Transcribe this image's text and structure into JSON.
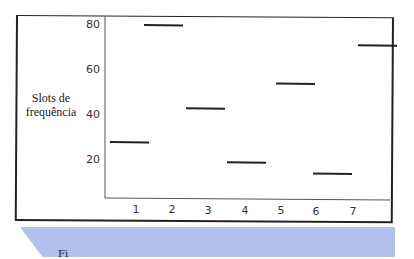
{
  "chart_data": {
    "type": "line",
    "subtype": "horizontal-segments (frequency hopping)",
    "title": "",
    "xlabel": "Tempo",
    "ylabel": "Slots de frequência",
    "x_ticks": [
      "1",
      "2",
      "3",
      "4",
      "5",
      "6",
      "7"
    ],
    "y_ticks": [
      "20",
      "40",
      "60",
      "80"
    ],
    "ylim": [
      0,
      85
    ],
    "grid": false,
    "legend": null,
    "series": [
      {
        "name": "frequency slot per time slot",
        "points": [
          {
            "time": 1,
            "slot": 28
          },
          {
            "time": 2,
            "slot": 80
          },
          {
            "time": 3,
            "slot": 43
          },
          {
            "time": 4,
            "slot": 19
          },
          {
            "time": 5,
            "slot": 54
          },
          {
            "time": 6,
            "slot": 14
          },
          {
            "time": 7,
            "slot": 71
          }
        ]
      }
    ]
  },
  "labels": {
    "ylabel_line1": "Slots de",
    "ylabel_line2": "frequência",
    "xlabel": "Tempo",
    "y_ticks": {
      "t80": "80",
      "t60": "60",
      "t40": "40",
      "t20": "20"
    },
    "x_ticks": [
      "1",
      "2",
      "3",
      "4",
      "5",
      "6",
      "7"
    ],
    "caption_fragment": "Fi"
  },
  "colors": {
    "line": "#222222",
    "axis": "#444444",
    "caption_band": "#b3c1ee"
  }
}
